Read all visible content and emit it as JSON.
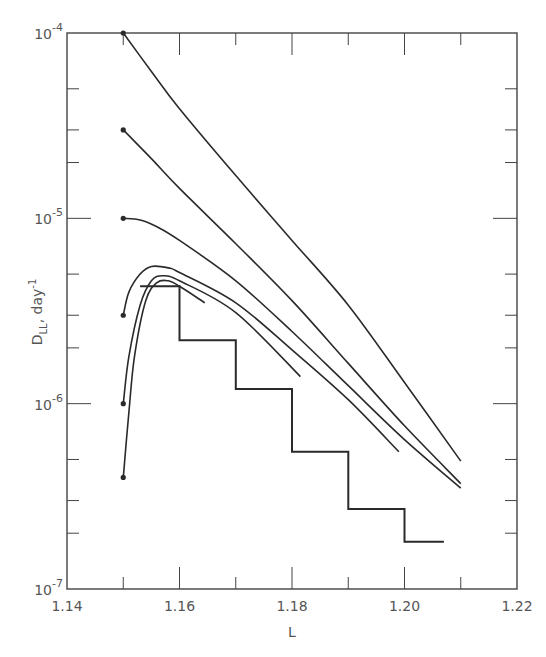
{
  "chart_data": {
    "type": "line",
    "title": "",
    "xlabel": "L",
    "ylabel": "D_LL , day^-1",
    "ylabel_main": "D",
    "ylabel_sub": "LL",
    "ylabel_rest": ", day",
    "ylabel_sup": "-1",
    "xlim": [
      1.14,
      1.22
    ],
    "ylim": [
      1e-07,
      0.0001
    ],
    "yscale": "log",
    "grid": false,
    "legend": null,
    "x_ticks": [
      1.14,
      1.16,
      1.18,
      1.2,
      1.22
    ],
    "x_tick_labels": [
      "1.14",
      "1.16",
      "1.18",
      "1.20",
      "1.22"
    ],
    "x_minor_ticks": [
      1.15,
      1.17,
      1.19,
      1.21
    ],
    "y_ticks": [
      {
        "base": "10",
        "exp": "-4",
        "value": 0.0001
      },
      {
        "base": "10",
        "exp": "-5",
        "value": 1e-05
      },
      {
        "base": "10",
        "exp": "-6",
        "value": 1e-06
      },
      {
        "base": "10",
        "exp": "-7",
        "value": 1e-07
      }
    ],
    "y_minor_ticks": [
      2,
      3,
      5
    ],
    "series": [
      {
        "name": "curve-start-1e-4",
        "marker_start": true,
        "points": [
          [
            1.15,
            0.0001
          ],
          [
            1.155,
            6.2e-05
          ],
          [
            1.16,
            3.9e-05
          ],
          [
            1.17,
            1.7e-05
          ],
          [
            1.18,
            7.6e-06
          ],
          [
            1.19,
            3.4e-06
          ],
          [
            1.2,
            1.3e-06
          ],
          [
            1.21,
            4.9e-07
          ]
        ]
      },
      {
        "name": "curve-start-3e-5",
        "marker_start": true,
        "points": [
          [
            1.15,
            3e-05
          ],
          [
            1.155,
            2.1e-05
          ],
          [
            1.16,
            1.45e-05
          ],
          [
            1.17,
            7.3e-06
          ],
          [
            1.18,
            3.6e-06
          ],
          [
            1.19,
            1.65e-06
          ],
          [
            1.2,
            7.6e-07
          ],
          [
            1.21,
            3.7e-07
          ]
        ]
      },
      {
        "name": "curve-start-1e-5",
        "marker_start": true,
        "points": [
          [
            1.15,
            1e-05
          ],
          [
            1.153,
            9.8e-06
          ],
          [
            1.156,
            9e-06
          ],
          [
            1.16,
            7.6e-06
          ],
          [
            1.17,
            4.6e-06
          ],
          [
            1.18,
            2.45e-06
          ],
          [
            1.19,
            1.25e-06
          ],
          [
            1.2,
            6.4e-07
          ],
          [
            1.21,
            3.5e-07
          ]
        ]
      },
      {
        "name": "curve-start-3e-6",
        "marker_start": true,
        "points": [
          [
            1.15,
            3e-06
          ],
          [
            1.151,
            4e-06
          ],
          [
            1.153,
            5e-06
          ],
          [
            1.155,
            5.5e-06
          ],
          [
            1.158,
            5.4e-06
          ],
          [
            1.16,
            5.1e-06
          ],
          [
            1.17,
            3.5e-06
          ],
          [
            1.18,
            1.95e-06
          ],
          [
            1.19,
            1.05e-06
          ],
          [
            1.199,
            5.5e-07
          ]
        ]
      },
      {
        "name": "curve-start-1e-6",
        "marker_start": true,
        "points": [
          [
            1.15,
            1e-06
          ],
          [
            1.151,
            1.8e-06
          ],
          [
            1.153,
            3.4e-06
          ],
          [
            1.155,
            4.6e-06
          ],
          [
            1.157,
            4.9e-06
          ],
          [
            1.16,
            4.6e-06
          ],
          [
            1.17,
            3.1e-06
          ],
          [
            1.1815,
            1.4e-06
          ]
        ]
      },
      {
        "name": "curve-start-4e-7",
        "marker_start": true,
        "points": [
          [
            1.15,
            4e-07
          ],
          [
            1.151,
            9e-07
          ],
          [
            1.152,
            1.8e-06
          ],
          [
            1.154,
            3.6e-06
          ],
          [
            1.156,
            4.5e-06
          ],
          [
            1.158,
            4.6e-06
          ],
          [
            1.16,
            4.3e-06
          ],
          [
            1.1645,
            3.5e-06
          ]
        ]
      },
      {
        "name": "histogram",
        "type": "step",
        "bins": [
          {
            "x0": 1.153,
            "x1": 1.16,
            "value": 4.3e-06
          },
          {
            "x0": 1.16,
            "x1": 1.17,
            "value": 2.2e-06
          },
          {
            "x0": 1.17,
            "x1": 1.18,
            "value": 1.2e-06
          },
          {
            "x0": 1.18,
            "x1": 1.19,
            "value": 5.5e-07
          },
          {
            "x0": 1.19,
            "x1": 1.2,
            "value": 2.7e-07
          },
          {
            "x0": 1.2,
            "x1": 1.207,
            "value": 1.8e-07
          }
        ]
      }
    ],
    "colors": {
      "line": "#2a2a2a",
      "axis": "#444444",
      "text": "#555555"
    }
  }
}
